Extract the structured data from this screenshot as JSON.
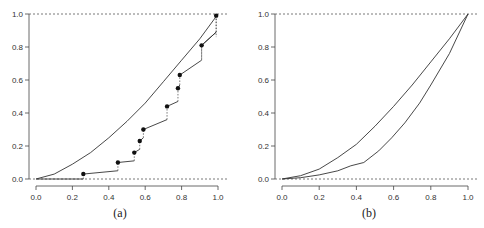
{
  "chart_data": [
    {
      "panel": "a",
      "type": "line",
      "caption": "(a)",
      "title": "",
      "xlabel": "",
      "ylabel": "",
      "xlim": [
        0,
        1
      ],
      "ylim": [
        0,
        1
      ],
      "x_ticks": [
        "0.0",
        "0.2",
        "0.4",
        "0.6",
        "0.8",
        "1.0"
      ],
      "y_ticks": [
        "0.0",
        "0.2",
        "0.4",
        "0.6",
        "0.8",
        "1.0"
      ],
      "grid": false,
      "reference_lines": [
        {
          "y": 0,
          "style": "dotted"
        },
        {
          "y": 1,
          "style": "dotted"
        }
      ],
      "series": [
        {
          "name": "smooth curve",
          "style": "solid",
          "x": [
            0.0,
            0.1,
            0.2,
            0.3,
            0.4,
            0.5,
            0.6,
            0.7,
            0.8,
            0.9,
            1.0
          ],
          "y": [
            0.0,
            0.03,
            0.09,
            0.16,
            0.25,
            0.35,
            0.46,
            0.59,
            0.72,
            0.85,
            1.0
          ]
        },
        {
          "name": "step points",
          "style": "points with piecewise segments and dotted jumps",
          "x": [
            0.26,
            0.45,
            0.54,
            0.57,
            0.59,
            0.72,
            0.78,
            0.79,
            0.91,
            0.99
          ],
          "y": [
            0.03,
            0.1,
            0.16,
            0.23,
            0.3,
            0.44,
            0.55,
            0.63,
            0.81,
            0.99
          ],
          "segment_end_y": [
            0.05,
            0.11,
            0.18,
            0.25,
            0.36,
            0.47,
            0.57,
            0.72,
            0.89,
            0.99
          ]
        }
      ]
    },
    {
      "panel": "b",
      "type": "line",
      "caption": "(b)",
      "title": "",
      "xlabel": "",
      "ylabel": "",
      "xlim": [
        0,
        1
      ],
      "ylim": [
        0,
        1
      ],
      "x_ticks": [
        "0.0",
        "0.2",
        "0.4",
        "0.6",
        "0.8",
        "1.0"
      ],
      "y_ticks": [
        "0.0",
        "0.2",
        "0.4",
        "0.6",
        "0.8",
        "1.0"
      ],
      "grid": false,
      "reference_lines": [
        {
          "y": 0,
          "style": "dotted"
        },
        {
          "y": 1,
          "style": "dotted"
        }
      ],
      "series": [
        {
          "name": "upper curve",
          "style": "solid",
          "x": [
            0.0,
            0.1,
            0.2,
            0.3,
            0.4,
            0.5,
            0.6,
            0.7,
            0.8,
            0.9,
            1.0
          ],
          "y": [
            0.0,
            0.02,
            0.06,
            0.13,
            0.21,
            0.32,
            0.44,
            0.57,
            0.71,
            0.85,
            1.0
          ]
        },
        {
          "name": "lower curve",
          "style": "solid",
          "x": [
            0.0,
            0.1,
            0.2,
            0.3,
            0.37,
            0.44,
            0.52,
            0.59,
            0.66,
            0.74,
            0.8,
            0.9,
            1.0
          ],
          "y": [
            0.0,
            0.008,
            0.025,
            0.05,
            0.08,
            0.1,
            0.17,
            0.25,
            0.34,
            0.46,
            0.57,
            0.76,
            1.0
          ]
        }
      ]
    }
  ]
}
